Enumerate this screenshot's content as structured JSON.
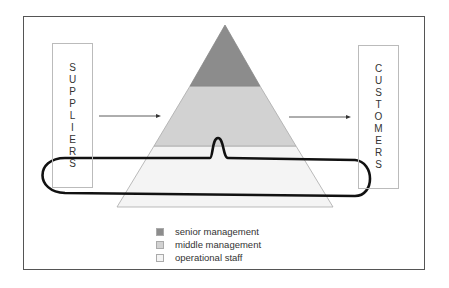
{
  "diagram": {
    "left_box": {
      "label": "SUPPLIERS",
      "letters": [
        "S",
        "U",
        "P",
        "P",
        "L",
        "I",
        "E",
        "R",
        "S"
      ]
    },
    "right_box": {
      "label": "CUSTOMERS",
      "letters": [
        "C",
        "U",
        "S",
        "T",
        "O",
        "M",
        "E",
        "R",
        "S"
      ]
    },
    "pyramid": {
      "levels": [
        {
          "name": "senior management",
          "color": "#8c8c8c"
        },
        {
          "name": "middle management",
          "color": "#d2d2d2"
        },
        {
          "name": "operational staff",
          "color": "#f4f4f4"
        }
      ]
    },
    "highlight_loop": "operational staff band encircled"
  },
  "legend": {
    "items": [
      {
        "label": "senior management",
        "color": "#8c8c8c"
      },
      {
        "label": "middle management",
        "color": "#d2d2d2"
      },
      {
        "label": "operational staff",
        "color": "#f4f4f4"
      }
    ]
  }
}
